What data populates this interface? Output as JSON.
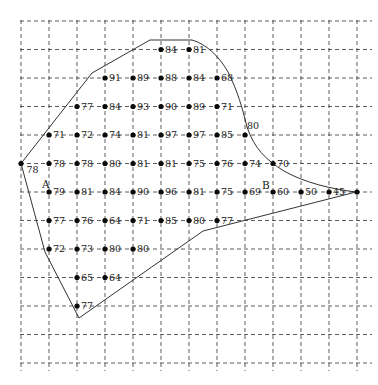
{
  "figure": {
    "colors": {
      "grid_line": "#4a4a4a",
      "boundary_line": "#333333",
      "dot": "#0a0a0a",
      "label_text": "#1a1a1a",
      "background": "#ffffff"
    },
    "grid": {
      "vertical_lines": 13,
      "horizontal_lines": 13,
      "style": "dashed"
    },
    "boundary": {
      "path": "M21,163.5 L92,73 L150,40 L192,40 C206,44 219,56 228,72 C238,92 242,107 247,127 C254,148 266,160 284,171 C305,183 332,189 356,192 L203,231 L79,318 L45,252 Z"
    },
    "markers": [
      {
        "text": "A",
        "x": 42,
        "y": 188
      },
      {
        "text": "B",
        "x": 262,
        "y": 189
      }
    ],
    "points": [
      {
        "col": 5,
        "row": 1,
        "value": "84"
      },
      {
        "col": 6,
        "row": 1,
        "value": "81"
      },
      {
        "col": 3,
        "row": 2,
        "value": "91"
      },
      {
        "col": 4,
        "row": 2,
        "value": "89"
      },
      {
        "col": 5,
        "row": 2,
        "value": "88"
      },
      {
        "col": 6,
        "row": 2,
        "value": "84"
      },
      {
        "col": 7,
        "row": 2,
        "value": "68"
      },
      {
        "col": 2,
        "row": 3,
        "value": "77"
      },
      {
        "col": 3,
        "row": 3,
        "value": "84"
      },
      {
        "col": 4,
        "row": 3,
        "value": "93"
      },
      {
        "col": 5,
        "row": 3,
        "value": "90"
      },
      {
        "col": 6,
        "row": 3,
        "value": "89"
      },
      {
        "col": 7,
        "row": 3,
        "value": "71"
      },
      {
        "col": 1,
        "row": 4,
        "value": "71"
      },
      {
        "col": 2,
        "row": 4,
        "value": "72"
      },
      {
        "col": 3,
        "row": 4,
        "value": "74"
      },
      {
        "col": 4,
        "row": 4,
        "value": "81"
      },
      {
        "col": 5,
        "row": 4,
        "value": "97"
      },
      {
        "col": 6,
        "row": 4,
        "value": "97"
      },
      {
        "col": 7,
        "row": 4,
        "value": "85"
      },
      {
        "col": 8,
        "row": 4,
        "value": "80",
        "label_pos": "above"
      },
      {
        "col": 0,
        "row": 5,
        "value": "78",
        "label_pos": "below"
      },
      {
        "col": 1,
        "row": 5,
        "value": "78"
      },
      {
        "col": 2,
        "row": 5,
        "value": "78"
      },
      {
        "col": 3,
        "row": 5,
        "value": "80"
      },
      {
        "col": 4,
        "row": 5,
        "value": "81"
      },
      {
        "col": 5,
        "row": 5,
        "value": "81"
      },
      {
        "col": 6,
        "row": 5,
        "value": "75"
      },
      {
        "col": 7,
        "row": 5,
        "value": "76"
      },
      {
        "col": 8,
        "row": 5,
        "value": "74"
      },
      {
        "col": 9,
        "row": 5,
        "value": "70"
      },
      {
        "col": 1,
        "row": 6,
        "value": "79"
      },
      {
        "col": 2,
        "row": 6,
        "value": "81"
      },
      {
        "col": 3,
        "row": 6,
        "value": "84"
      },
      {
        "col": 4,
        "row": 6,
        "value": "90"
      },
      {
        "col": 5,
        "row": 6,
        "value": "96"
      },
      {
        "col": 6,
        "row": 6,
        "value": "81"
      },
      {
        "col": 7,
        "row": 6,
        "value": "75"
      },
      {
        "col": 8,
        "row": 6,
        "value": "69"
      },
      {
        "col": 9,
        "row": 6,
        "value": "60"
      },
      {
        "col": 10,
        "row": 6,
        "value": "50"
      },
      {
        "col": 11,
        "row": 6,
        "value": "45"
      },
      {
        "col": 12,
        "row": 6,
        "value": ""
      },
      {
        "col": 1,
        "row": 7,
        "value": "77"
      },
      {
        "col": 2,
        "row": 7,
        "value": "76"
      },
      {
        "col": 3,
        "row": 7,
        "value": "64"
      },
      {
        "col": 4,
        "row": 7,
        "value": "71"
      },
      {
        "col": 5,
        "row": 7,
        "value": "85"
      },
      {
        "col": 6,
        "row": 7,
        "value": "80"
      },
      {
        "col": 7,
        "row": 7,
        "value": "77"
      },
      {
        "col": 1,
        "row": 8,
        "value": "72"
      },
      {
        "col": 2,
        "row": 8,
        "value": "73"
      },
      {
        "col": 3,
        "row": 8,
        "value": "80"
      },
      {
        "col": 4,
        "row": 8,
        "value": "80"
      },
      {
        "col": 2,
        "row": 9,
        "value": "65"
      },
      {
        "col": 3,
        "row": 9,
        "value": "64"
      },
      {
        "col": 2,
        "row": 10,
        "value": "77"
      }
    ]
  }
}
